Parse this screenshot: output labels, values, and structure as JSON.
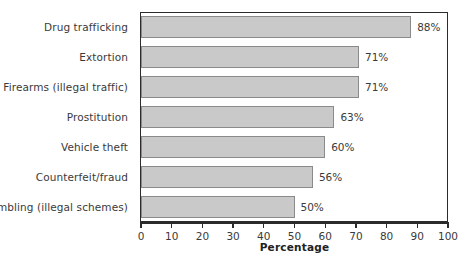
{
  "chart_data": {
    "type": "bar",
    "orientation": "horizontal",
    "title": "",
    "xlabel": "Percentage",
    "ylabel": "",
    "xlim": [
      0,
      100
    ],
    "xticks": [
      0,
      10,
      20,
      30,
      40,
      50,
      60,
      70,
      80,
      90,
      100
    ],
    "grid": false,
    "legend": null,
    "categories": [
      "Drug trafficking",
      "Extortion",
      "Firearms (illegal traffic)",
      "Prostitution",
      "Vehicle theft",
      "Counterfeit/fraud",
      "Gambling (illegal schemes)"
    ],
    "values": [
      88,
      71,
      71,
      63,
      60,
      56,
      50
    ],
    "value_labels": [
      "88%",
      "71%",
      "71%",
      "63%",
      "60%",
      "56%",
      "50%"
    ],
    "bar_fill_color": "#c9c9c9",
    "bar_edge_color": "#8a8a8a",
    "axis_color": "#2b2b2b",
    "text_color": "#3a3a3a",
    "background_color": "#ffffff"
  }
}
